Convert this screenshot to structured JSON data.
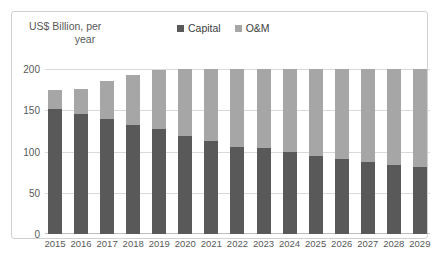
{
  "chart_data": {
    "type": "bar",
    "subtype": "stacked-column",
    "title": "",
    "ylabel": "US$ Billion, per year",
    "xlabel": "",
    "ylim": [
      0,
      200
    ],
    "yticks": [
      0,
      50,
      100,
      150,
      200
    ],
    "grid": true,
    "legend_position": "top-center",
    "categories": [
      "2015",
      "2016",
      "2017",
      "2018",
      "2019",
      "2020",
      "2021",
      "2022",
      "2023",
      "2024",
      "2025",
      "2026",
      "2027",
      "2028",
      "2029"
    ],
    "series": [
      {
        "name": "Capital",
        "color": "#595959",
        "values": [
          152,
          145,
          139,
          132,
          127,
          121,
          116,
          111,
          113,
          108,
          102,
          98,
          94,
          90,
          86
        ]
      },
      {
        "name": "O&M",
        "color": "#a6a6a6",
        "values": [
          23,
          31,
          47,
          61,
          72,
          82,
          89,
          99,
          105,
          110,
          115,
          119,
          122,
          125,
          126
        ]
      }
    ],
    "totals": [
      175,
      176,
      186,
      193,
      199,
      203,
      205,
      210,
      218,
      218,
      217,
      217,
      216,
      215,
      212
    ]
  },
  "axis_title": {
    "line1": "US$ Billion, per",
    "line2": "year"
  },
  "legend": {
    "items": [
      {
        "label": "Capital",
        "color": "#595959"
      },
      {
        "label": "O&M",
        "color": "#a6a6a6"
      }
    ]
  },
  "colors": {
    "capital": "#595959",
    "om": "#a6a6a6",
    "gridline": "#d9d9d9",
    "border": "#d0d0d0",
    "text": "#595959"
  }
}
